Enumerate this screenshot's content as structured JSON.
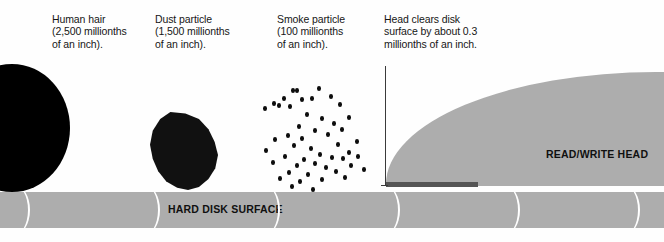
{
  "diagram": {
    "width": 664,
    "height": 242,
    "background_color": "#fefefe"
  },
  "captions": {
    "human_hair": "Human hair\n(2,500 millionths\nof an inch).",
    "dust_particle": "Dust particle\n(1,500 millionths\nof an inch).",
    "smoke_particle": "Smoke particle\n(100 millionths\nof an inch).",
    "head_clearance": "Head clears disk\nsurface by about 0.3\nmillionths of an inch."
  },
  "labels": {
    "disk_surface": "HARD DISK SURFACE",
    "read_write_head": "READ/WRITE HEAD"
  },
  "colors": {
    "particle_black": "#111111",
    "hair_black": "#000000",
    "surface_gray": "#adadad",
    "head_gap_bar": "#555555",
    "arc_white": "#ffffff",
    "measurement_line": "#3a3a3a",
    "text_black": "#161616"
  },
  "chart_data": {
    "type": "bar",
    "xlabel": "Object",
    "ylabel": "Size (millionths of an inch)",
    "categories": [
      "Human hair",
      "Dust particle",
      "Smoke particle",
      "Head clearance"
    ],
    "values": [
      2500,
      1500,
      100,
      0.3
    ],
    "unit": "millionths of an inch",
    "ylim": [
      0,
      2500
    ],
    "grid": false,
    "legend": false,
    "annotations": [
      "Human hair (2,500 millionths of an inch).",
      "Dust particle (1,500 millionths of an inch).",
      "Smoke particle (100 millionths of an inch).",
      "Head clears disk surface by about 0.3 millionths of an inch."
    ]
  },
  "smoke_dots": [
    [
      291,
      88
    ],
    [
      295,
      88
    ],
    [
      317,
      86
    ],
    [
      282,
      96
    ],
    [
      300,
      97
    ],
    [
      310,
      96
    ],
    [
      329,
      94
    ],
    [
      272,
      101
    ],
    [
      277,
      103
    ],
    [
      288,
      104
    ],
    [
      263,
      106
    ],
    [
      338,
      102
    ],
    [
      305,
      112
    ],
    [
      320,
      116
    ],
    [
      347,
      115
    ],
    [
      332,
      121
    ],
    [
      297,
      124
    ],
    [
      340,
      127
    ],
    [
      313,
      128
    ],
    [
      286,
      133
    ],
    [
      300,
      136
    ],
    [
      326,
      132
    ],
    [
      273,
      137
    ],
    [
      355,
      139
    ],
    [
      292,
      143
    ],
    [
      309,
      146
    ],
    [
      336,
      142
    ],
    [
      264,
      148
    ],
    [
      318,
      152
    ],
    [
      347,
      150
    ],
    [
      283,
      154
    ],
    [
      302,
      157
    ],
    [
      330,
      155
    ],
    [
      341,
      156
    ],
    [
      356,
      154
    ],
    [
      271,
      160
    ],
    [
      295,
      163
    ],
    [
      313,
      161
    ],
    [
      324,
      165
    ],
    [
      349,
      163
    ],
    [
      287,
      170
    ],
    [
      306,
      172
    ],
    [
      334,
      169
    ],
    [
      362,
      167
    ],
    [
      278,
      176
    ],
    [
      298,
      179
    ],
    [
      320,
      177
    ],
    [
      343,
      175
    ],
    [
      290,
      184
    ],
    [
      311,
      187
    ]
  ],
  "disk_arc_positions": [
    30,
    160,
    280,
    400,
    520,
    640
  ]
}
